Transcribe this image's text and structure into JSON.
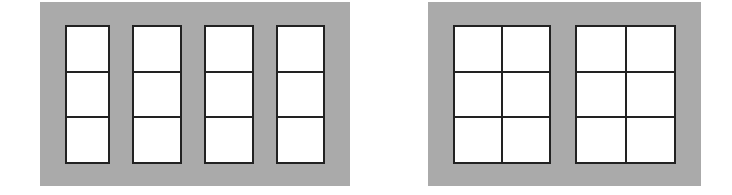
{
  "figures": [
    {
      "id": "left",
      "description": "Four narrow window units, each 1 column x 3 rows",
      "panel": {
        "x": 40,
        "y": 2,
        "w": 310,
        "h": 184,
        "color": "#aaaaaa"
      },
      "windows": [
        {
          "x": 65,
          "y": 25,
          "w": 45,
          "h": 139,
          "cols": 1,
          "rows": 3
        },
        {
          "x": 132,
          "y": 25,
          "w": 50,
          "h": 139,
          "cols": 1,
          "rows": 3
        },
        {
          "x": 204,
          "y": 25,
          "w": 50,
          "h": 139,
          "cols": 1,
          "rows": 3
        },
        {
          "x": 276,
          "y": 25,
          "w": 49,
          "h": 139,
          "cols": 1,
          "rows": 3
        }
      ]
    },
    {
      "id": "right",
      "description": "Two wide window units, each 2 columns x 3 rows",
      "panel": {
        "x": 428,
        "y": 2,
        "w": 273,
        "h": 184,
        "color": "#aaaaaa"
      },
      "windows": [
        {
          "x": 453,
          "y": 25,
          "w": 98,
          "h": 139,
          "cols": 2,
          "rows": 3
        },
        {
          "x": 575,
          "y": 25,
          "w": 101,
          "h": 139,
          "cols": 2,
          "rows": 3
        }
      ]
    }
  ],
  "colors": {
    "background": "#ffffff",
    "panel": "#aaaaaa",
    "frame": "#222222",
    "pane": "#ffffff"
  }
}
